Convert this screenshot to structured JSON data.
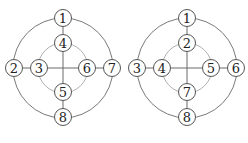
{
  "figure": {
    "diagrams": [
      {
        "name": "left",
        "center": [
          63,
          68
        ],
        "outer_radius": 50,
        "inner_radius": 25,
        "nodes": [
          {
            "label": "1",
            "x": 63,
            "y": 18
          },
          {
            "label": "2",
            "x": 14,
            "y": 68
          },
          {
            "label": "3",
            "x": 39,
            "y": 68
          },
          {
            "label": "4",
            "x": 63,
            "y": 43
          },
          {
            "label": "5",
            "x": 63,
            "y": 92
          },
          {
            "label": "6",
            "x": 87,
            "y": 68
          },
          {
            "label": "7",
            "x": 112,
            "y": 68
          },
          {
            "label": "8",
            "x": 63,
            "y": 117
          }
        ]
      },
      {
        "name": "right",
        "center": [
          187,
          68
        ],
        "outer_radius": 50,
        "inner_radius": 25,
        "nodes": [
          {
            "label": "1",
            "x": 187,
            "y": 18
          },
          {
            "label": "2",
            "x": 187,
            "y": 43
          },
          {
            "label": "3",
            "x": 137,
            "y": 68
          },
          {
            "label": "4",
            "x": 162,
            "y": 68
          },
          {
            "label": "5",
            "x": 211,
            "y": 68
          },
          {
            "label": "6",
            "x": 236,
            "y": 68
          },
          {
            "label": "7",
            "x": 187,
            "y": 92
          },
          {
            "label": "8",
            "x": 187,
            "y": 117
          }
        ]
      }
    ],
    "colors": {
      "outer_ring": "#7a7a7a",
      "inner_ring": "#b0b0b0",
      "node_stroke": "#555555",
      "text": "#222222"
    }
  }
}
